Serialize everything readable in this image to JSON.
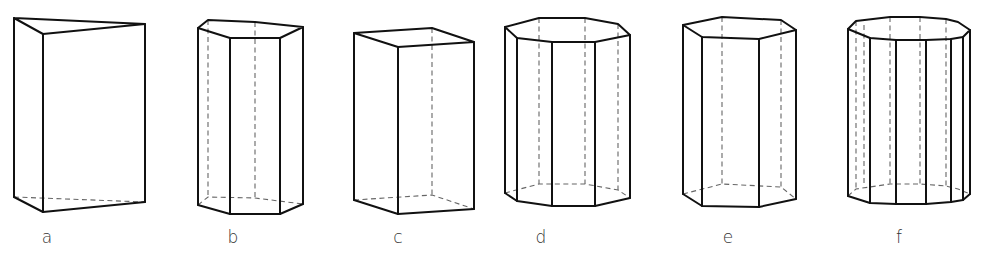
{
  "figure": {
    "title": "",
    "prisms": [
      {
        "label": "a",
        "shape": "triangular prism",
        "solid_lines": [
          [
            [
              14,
              18
            ],
            [
              43,
              34
            ],
            [
              145,
              24
            ],
            [
              14,
              18
            ]
          ],
          [
            [
              14,
              18
            ],
            [
              14,
              197
            ]
          ],
          [
            [
              43,
              34
            ],
            [
              43,
              212
            ]
          ],
          [
            [
              145,
              24
            ],
            [
              145,
              202
            ]
          ],
          [
            [
              14,
              197
            ],
            [
              43,
              212
            ],
            [
              145,
              202
            ]
          ]
        ],
        "hidden_lines": [
          [
            [
              14,
              197
            ],
            [
              145,
              202
            ]
          ]
        ],
        "label_pos": [
          47,
          243
        ]
      },
      {
        "label": "b",
        "shape": "pentagonal prism",
        "solid_lines": [
          [
            [
              198,
              28
            ],
            [
              208,
              20
            ],
            [
              255,
              22
            ],
            [
              303,
              27
            ],
            [
              280,
              38
            ],
            [
              230,
              38
            ],
            [
              198,
              28
            ]
          ],
          [
            [
              198,
              28
            ],
            [
              198,
              205
            ]
          ],
          [
            [
              230,
              38
            ],
            [
              230,
              214
            ]
          ],
          [
            [
              280,
              38
            ],
            [
              280,
              214
            ]
          ],
          [
            [
              303,
              27
            ],
            [
              303,
              204
            ]
          ],
          [
            [
              198,
              205
            ],
            [
              230,
              214
            ],
            [
              280,
              214
            ],
            [
              303,
              204
            ]
          ]
        ],
        "hidden_lines": [
          [
            [
              208,
              20
            ],
            [
              208,
              197
            ]
          ],
          [
            [
              255,
              22
            ],
            [
              255,
              198
            ]
          ],
          [
            [
              198,
              205
            ],
            [
              208,
              197
            ],
            [
              255,
              198
            ],
            [
              303,
              204
            ]
          ]
        ],
        "label_pos": [
          233,
          243
        ]
      },
      {
        "label": "c",
        "shape": "rectangular prism",
        "solid_lines": [
          [
            [
              354,
              33
            ],
            [
              432,
              28
            ],
            [
              474,
              42
            ],
            [
              398,
              47
            ],
            [
              354,
              33
            ]
          ],
          [
            [
              354,
              33
            ],
            [
              354,
              200
            ]
          ],
          [
            [
              398,
              47
            ],
            [
              398,
              214
            ]
          ],
          [
            [
              474,
              42
            ],
            [
              474,
              209
            ]
          ],
          [
            [
              354,
              200
            ],
            [
              398,
              214
            ],
            [
              474,
              209
            ]
          ]
        ],
        "hidden_lines": [
          [
            [
              432,
              28
            ],
            [
              432,
              195
            ]
          ],
          [
            [
              354,
              200
            ],
            [
              432,
              195
            ],
            [
              474,
              209
            ]
          ]
        ],
        "label_pos": [
          398,
          243
        ]
      },
      {
        "label": "d",
        "shape": "octagonal prism",
        "solid_lines": [
          [
            [
              505,
              27
            ],
            [
              539,
              18
            ],
            [
              585,
              18
            ],
            [
              618,
              24
            ],
            [
              630,
              35
            ],
            [
              595,
              42
            ],
            [
              552,
              42
            ],
            [
              517,
              38
            ],
            [
              505,
              27
            ]
          ],
          [
            [
              505,
              27
            ],
            [
              505,
              193
            ]
          ],
          [
            [
              517,
              38
            ],
            [
              517,
              201
            ]
          ],
          [
            [
              552,
              42
            ],
            [
              552,
              206
            ]
          ],
          [
            [
              595,
              42
            ],
            [
              595,
              206
            ]
          ],
          [
            [
              630,
              35
            ],
            [
              630,
              198
            ]
          ],
          [
            [
              505,
              193
            ],
            [
              517,
              201
            ],
            [
              552,
              206
            ],
            [
              595,
              206
            ],
            [
              630,
              198
            ]
          ]
        ],
        "hidden_lines": [
          [
            [
              539,
              18
            ],
            [
              539,
              184
            ]
          ],
          [
            [
              585,
              18
            ],
            [
              585,
              184
            ]
          ],
          [
            [
              618,
              24
            ],
            [
              618,
              190
            ]
          ],
          [
            [
              505,
              193
            ],
            [
              539,
              184
            ],
            [
              585,
              184
            ],
            [
              618,
              190
            ],
            [
              630,
              198
            ]
          ]
        ],
        "label_pos": [
          541,
          243
        ]
      },
      {
        "label": "e",
        "shape": "hexagonal prism",
        "solid_lines": [
          [
            [
              683,
              25
            ],
            [
              722,
              17
            ],
            [
              781,
              20
            ],
            [
              796,
              30
            ],
            [
              759,
              39
            ],
            [
              702,
              37
            ],
            [
              683,
              25
            ]
          ],
          [
            [
              683,
              25
            ],
            [
              683,
              194
            ]
          ],
          [
            [
              702,
              37
            ],
            [
              702,
              206
            ]
          ],
          [
            [
              759,
              39
            ],
            [
              759,
              207
            ]
          ],
          [
            [
              796,
              30
            ],
            [
              796,
              199
            ]
          ],
          [
            [
              683,
              194
            ],
            [
              702,
              206
            ],
            [
              759,
              207
            ],
            [
              796,
              199
            ]
          ]
        ],
        "hidden_lines": [
          [
            [
              722,
              17
            ],
            [
              722,
              184
            ]
          ],
          [
            [
              781,
              20
            ],
            [
              781,
              187
            ]
          ],
          [
            [
              683,
              194
            ],
            [
              722,
              184
            ],
            [
              781,
              187
            ],
            [
              796,
              199
            ]
          ]
        ],
        "label_pos": [
          728,
          243
        ]
      },
      {
        "label": "f",
        "shape": "decagonal prism",
        "solid_lines": [
          [
            [
              848,
              29
            ],
            [
              856,
              21
            ],
            [
              890,
              17
            ],
            [
              920,
              17
            ],
            [
              946,
              19
            ],
            [
              958,
              22
            ],
            [
              970,
              30
            ],
            [
              963,
              37
            ],
            [
              951,
              39
            ],
            [
              926,
              40
            ],
            [
              896,
              40
            ],
            [
              870,
              38
            ],
            [
              848,
              29
            ]
          ],
          [
            [
              848,
              29
            ],
            [
              848,
              196
            ]
          ],
          [
            [
              870,
              38
            ],
            [
              870,
              203
            ]
          ],
          [
            [
              896,
              40
            ],
            [
              896,
              204
            ]
          ],
          [
            [
              926,
              40
            ],
            [
              926,
              204
            ]
          ],
          [
            [
              951,
              39
            ],
            [
              951,
              202
            ]
          ],
          [
            [
              963,
              37
            ],
            [
              963,
              200
            ]
          ],
          [
            [
              970,
              30
            ],
            [
              970,
              194
            ]
          ],
          [
            [
              848,
              196
            ],
            [
              870,
              203
            ],
            [
              896,
              204
            ],
            [
              926,
              204
            ],
            [
              951,
              202
            ],
            [
              963,
              200
            ],
            [
              970,
              194
            ]
          ]
        ],
        "hidden_lines": [
          [
            [
              856,
              21
            ],
            [
              856,
              189
            ]
          ],
          [
            [
              864,
              25
            ],
            [
              864,
              186
            ]
          ],
          [
            [
              890,
              17
            ],
            [
              890,
              184
            ]
          ],
          [
            [
              920,
              17
            ],
            [
              920,
              184
            ]
          ],
          [
            [
              946,
              19
            ],
            [
              946,
              186
            ]
          ],
          [
            [
              848,
              196
            ],
            [
              856,
              189
            ],
            [
              890,
              184
            ],
            [
              920,
              184
            ],
            [
              946,
              186
            ],
            [
              958,
              189
            ],
            [
              970,
              194
            ]
          ]
        ],
        "label_pos": [
          899,
          243
        ]
      }
    ]
  }
}
